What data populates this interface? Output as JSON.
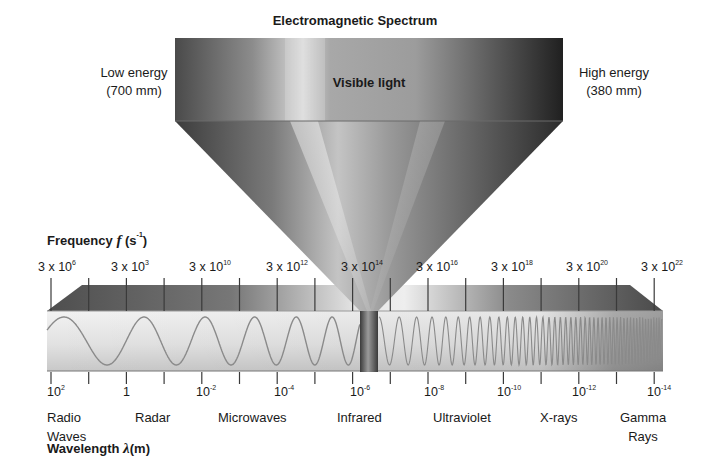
{
  "title": "Electromagnetic Spectrum",
  "visible_band": {
    "label": "Visible light",
    "low_end": {
      "line1": "Low energy",
      "line2": "(700 mm)"
    },
    "high_end": {
      "line1": "High energy",
      "line2": "(380 mm)"
    }
  },
  "frequency_axis": {
    "title": "Frequency",
    "symbol": "f",
    "unit_base": "(s",
    "unit_exp": "-1",
    "unit_close": ")",
    "labels": [
      {
        "base": "3 x 10",
        "exp": "6"
      },
      {
        "base": "3 x 10",
        "exp": "3"
      },
      {
        "base": "3 x 10",
        "exp": "10"
      },
      {
        "base": "3 x 10",
        "exp": "12"
      },
      {
        "base": "3 x 10",
        "exp": "14"
      },
      {
        "base": "3 x 10",
        "exp": "16"
      },
      {
        "base": "3 x 10",
        "exp": "18"
      },
      {
        "base": "3 x 10",
        "exp": "20"
      },
      {
        "base": "3 x 10",
        "exp": "22"
      }
    ]
  },
  "wavelength_axis": {
    "title": "Wavelength",
    "symbol": "λ",
    "unit": "(m)",
    "labels": [
      {
        "base": "10",
        "exp": "2"
      },
      {
        "base": "1",
        "exp": ""
      },
      {
        "base": "10",
        "exp": "-2"
      },
      {
        "base": "10",
        "exp": "-4"
      },
      {
        "base": "10",
        "exp": "-6"
      },
      {
        "base": "10",
        "exp": "-8"
      },
      {
        "base": "10",
        "exp": "-10"
      },
      {
        "base": "10",
        "exp": "-12"
      },
      {
        "base": "10",
        "exp": "-14"
      }
    ]
  },
  "regions": [
    {
      "line1": "Radio",
      "line2": "Waves"
    },
    {
      "line1": "Radar",
      "line2": ""
    },
    {
      "line1": "Microwaves",
      "line2": ""
    },
    {
      "line1": "Infrared",
      "line2": ""
    },
    {
      "line1": "Ultraviolet",
      "line2": ""
    },
    {
      "line1": "X-rays",
      "line2": ""
    },
    {
      "line1": "Gamma",
      "line2": "Rays"
    }
  ],
  "colors": {
    "wave": "#8a8a8a",
    "tick": "#3a3a3a",
    "text": "#1a1a1a"
  }
}
